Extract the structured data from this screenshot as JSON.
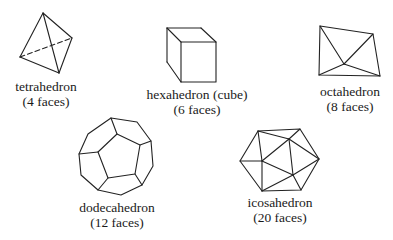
{
  "figure": {
    "solids": [
      {
        "id": "tetrahedron",
        "name": "tetrahedron",
        "faces_label": "(4 faces)",
        "faces": 4
      },
      {
        "id": "hexahedron",
        "name": "hexahedron (cube)",
        "faces_label": "(6 faces)",
        "faces": 6
      },
      {
        "id": "octahedron",
        "name": "octahedron",
        "faces_label": "(8 faces)",
        "faces": 8
      },
      {
        "id": "dodecahedron",
        "name": "dodecahedron",
        "faces_label": "(12 faces)",
        "faces": 12
      },
      {
        "id": "icosahedron",
        "name": "icosahedron",
        "faces_label": "(20 faces)",
        "faces": 20
      }
    ]
  }
}
